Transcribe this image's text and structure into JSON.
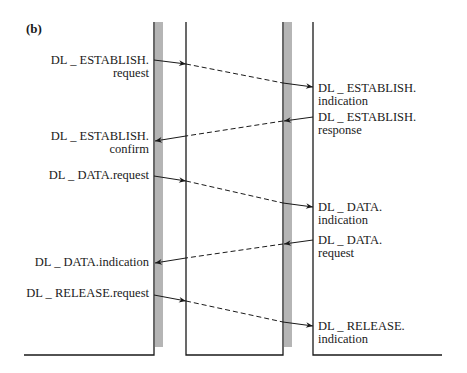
{
  "figure": {
    "panel_label": "(b)",
    "colors": {
      "line": "#1a1a1a",
      "gray_bar": "#b5b5b5",
      "background": "#ffffff"
    },
    "left_labels": [
      {
        "line1": "DL _ ESTABLISH.",
        "line2": "request"
      },
      {
        "line1": "DL _ ESTABLISH.",
        "line2": "confirm"
      },
      {
        "line1": "DL _ DATA.request",
        "line2": ""
      },
      {
        "line1": "DL _ DATA.indication",
        "line2": ""
      },
      {
        "line1": "DL _ RELEASE.request",
        "line2": ""
      }
    ],
    "right_labels": [
      {
        "line1": "DL _ ESTABLISH.",
        "line2": "indication"
      },
      {
        "line1": "DL _ ESTABLISH.",
        "line2": "response"
      },
      {
        "line1": "DL _ DATA.",
        "line2": "indication"
      },
      {
        "line1": "DL _ DATA.",
        "line2": "request"
      },
      {
        "line1": "DL _ RELEASE.",
        "line2": "indication"
      }
    ],
    "messages": [
      {
        "from": "left",
        "to": "right",
        "name": "DL_ESTABLISH.request → DL_ESTABLISH.indication"
      },
      {
        "from": "right",
        "to": "left",
        "name": "DL_ESTABLISH.response → DL_ESTABLISH.confirm"
      },
      {
        "from": "left",
        "to": "right",
        "name": "DL_DATA.request → DL_DATA.indication"
      },
      {
        "from": "right",
        "to": "left",
        "name": "DL_DATA.request → DL_DATA.indication"
      },
      {
        "from": "left",
        "to": "right",
        "name": "DL_RELEASE.request → DL_RELEASE.indication"
      }
    ]
  }
}
